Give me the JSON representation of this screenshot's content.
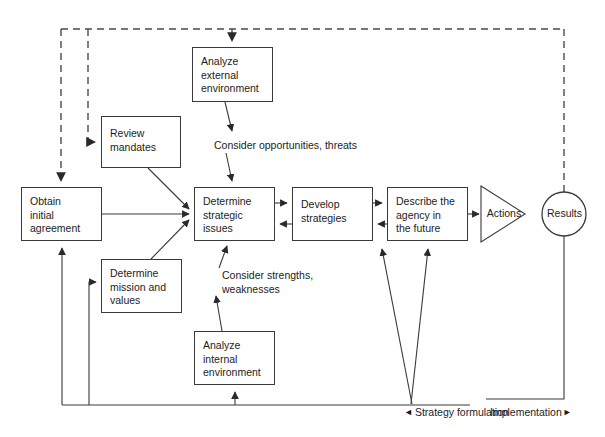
{
  "diagram": {
    "stroke_color": "#3a3a3a",
    "text_color": "#1c1c1c",
    "background": "#ffffff",
    "nodes": [
      {
        "id": "analyze_external",
        "label": "Analyze\nexternal\nenvironment",
        "shape": "rect",
        "x": 192,
        "y": 47,
        "w": 81,
        "h": 55
      },
      {
        "id": "review_mandates",
        "label": "Review\nmandates",
        "shape": "rect",
        "x": 101,
        "y": 116,
        "w": 80,
        "h": 52
      },
      {
        "id": "obtain_initial_agreement",
        "label": "Obtain\ninitial\nagreement",
        "shape": "rect",
        "x": 21,
        "y": 187,
        "w": 81,
        "h": 54
      },
      {
        "id": "determine_strategic_issues",
        "label": "Determine\nstrategic\nissues",
        "shape": "rect",
        "x": 194,
        "y": 187,
        "w": 81,
        "h": 54
      },
      {
        "id": "develop_strategies",
        "label": "Develop\nstrategies",
        "shape": "rect",
        "x": 292,
        "y": 187,
        "w": 81,
        "h": 54
      },
      {
        "id": "describe_agency_future",
        "label": "Describe the\nagency in\nthe future",
        "shape": "rect",
        "x": 387,
        "y": 187,
        "w": 81,
        "h": 54
      },
      {
        "id": "determine_mission_values",
        "label": "Determine\nmission and\nvalues",
        "shape": "rect",
        "x": 101,
        "y": 259,
        "w": 81,
        "h": 54
      },
      {
        "id": "analyze_internal",
        "label": "Analyze\ninternal\nenvironment",
        "shape": "rect",
        "x": 194,
        "y": 331,
        "w": 81,
        "h": 54
      },
      {
        "id": "actions",
        "label": "Actions",
        "shape": "triangle",
        "x": 481,
        "y": 186,
        "w": 44,
        "h": 56
      },
      {
        "id": "results",
        "label": "Results",
        "shape": "circle",
        "cx": 564,
        "cy": 214,
        "r": 22
      }
    ],
    "edge_labels": [
      {
        "id": "consider_opportunities",
        "text": "Consider opportunities, threats",
        "x": 214,
        "y": 139
      },
      {
        "id": "consider_strengths",
        "text": "Consider strengths,\nweaknesses",
        "x": 222,
        "y": 269
      }
    ],
    "phase_labels": [
      {
        "id": "strategy_formulation",
        "marker": "◄",
        "text": "Strategy formulation",
        "x": 404,
        "y": 406
      },
      {
        "id": "implementation",
        "marker": "►",
        "text": "Implementation",
        "x": 490,
        "y": 406
      }
    ]
  }
}
